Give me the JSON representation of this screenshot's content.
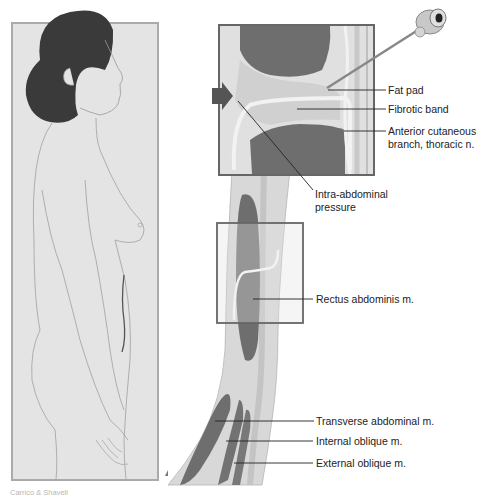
{
  "figure": {
    "type": "anatomical-illustration",
    "left_panel": {
      "description": "side-view-female-figure"
    },
    "right_panel": {
      "description": "cross-section-abdominal-wall-with-needle"
    }
  },
  "labels": {
    "fat_pad": "Fat pad",
    "fibrotic_band": "Fibrotic band",
    "anterior_cutaneous_line1": "Anterior cutaneous",
    "anterior_cutaneous_line2": "branch, thoracic n.",
    "intra_abdominal_line1": "Intra-abdominal",
    "intra_abdominal_line2": "pressure",
    "rectus_abdominis": "Rectus abdominis m.",
    "transverse_abdominal": "Transverse abdominal m.",
    "internal_oblique": "Internal oblique m.",
    "external_oblique": "External oblique m."
  },
  "credit": "Carrico & Shavell",
  "colors": {
    "panel_bg": "#e4e4e4",
    "frame": "#6a6a6a",
    "hair": "#3a3a3a",
    "muscle": "#6e6e6e",
    "fat": "#d2d2d2",
    "skin_layer": "#c4c4c4",
    "arrow": "#555555"
  }
}
